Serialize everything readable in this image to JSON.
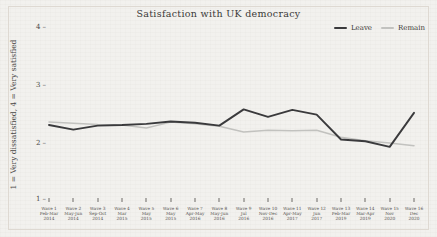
{
  "chart_data": {
    "type": "line",
    "title": "Satisfaction with UK democracy",
    "xlabel": "",
    "ylabel": "1 = Very dissatisfied, 4 = Very satisfied",
    "ylim": [
      1,
      4
    ],
    "yticks": [
      "1",
      "2",
      "3",
      "4"
    ],
    "ytick_values": [
      1,
      2,
      3,
      4
    ],
    "grid": false,
    "legend_position": "top-right",
    "categories": [
      "Wave 1\nFeb-Mar\n2014",
      "Wave 2\nMay-Jun\n2014",
      "Wave 3\nSep-Oct\n2014",
      "Wave 4\nMar\n2015",
      "Wave 5\nMay\n2015",
      "Wave 6\nMay\n2015",
      "Wave 7\nApr-May\n2016",
      "Wave 8\nMay-Jun\n2016",
      "Wave 9\nJul\n2016",
      "Wave 10\nNov-Dec\n2016",
      "Wave 11\nApr-May\n2017",
      "Wave 12\nJun\n2017",
      "Wave 13\nFeb-Mar\n2019",
      "Wave 14\nMar-Apr\n2019",
      "Wave 15\nNov\n2020",
      "Wave 16\nDec\n2020"
    ],
    "category_lines": [
      [
        "Wave 1",
        "Feb-Mar",
        "2014"
      ],
      [
        "Wave 2",
        "May-Jun",
        "2014"
      ],
      [
        "Wave 3",
        "Sep-Oct",
        "2014"
      ],
      [
        "Wave 4",
        "Mar",
        "2015"
      ],
      [
        "Wave 5",
        "May",
        "2015"
      ],
      [
        "Wave 6",
        "May",
        "2015"
      ],
      [
        "Wave 7",
        "Apr-May",
        "2016"
      ],
      [
        "Wave 8",
        "May-Jun",
        "2016"
      ],
      [
        "Wave 9",
        "Jul",
        "2016"
      ],
      [
        "Wave 10",
        "Nov-Dec",
        "2016"
      ],
      [
        "Wave 11",
        "Apr-May",
        "2017"
      ],
      [
        "Wave 12",
        "Jun",
        "2017"
      ],
      [
        "Wave 13",
        "Feb-Mar",
        "2019"
      ],
      [
        "Wave 14",
        "Mar-Apr",
        "2019"
      ],
      [
        "Wave 15",
        "Nov",
        "2020"
      ],
      [
        "Wave 16",
        "Dec",
        "2020"
      ]
    ],
    "series": [
      {
        "name": "Leave",
        "color": "#3a3a3c",
        "values": [
          2.31,
          2.23,
          2.3,
          2.31,
          2.33,
          2.37,
          2.35,
          2.3,
          2.58,
          2.45,
          2.57,
          2.49,
          2.06,
          2.03,
          1.93,
          2.52
        ]
      },
      {
        "name": "Remain",
        "color": "#c2c2bf",
        "values": [
          2.36,
          2.34,
          2.32,
          2.31,
          2.26,
          2.36,
          2.33,
          2.29,
          2.19,
          2.22,
          2.21,
          2.22,
          2.1,
          2.04,
          2.0,
          1.95
        ]
      }
    ]
  },
  "legend": {
    "items": [
      {
        "label": "Leave",
        "color": "#3a3a3c"
      },
      {
        "label": "Remain",
        "color": "#c2c2bf"
      }
    ]
  }
}
